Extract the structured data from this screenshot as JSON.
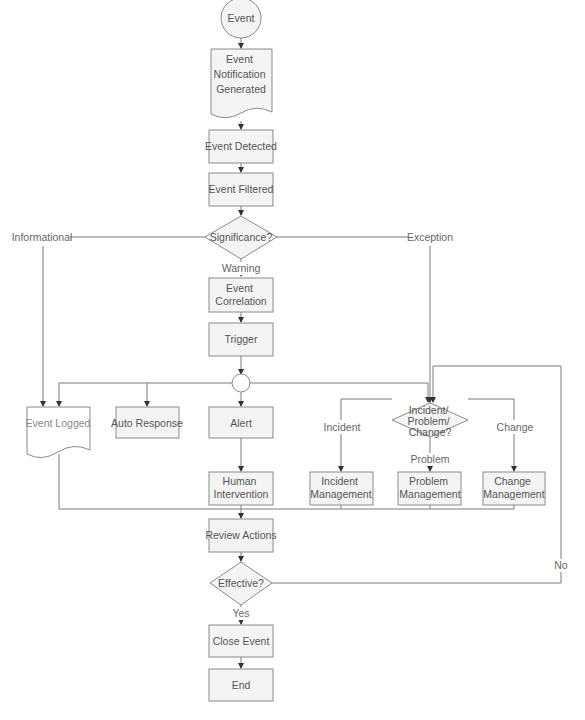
{
  "diagram": {
    "colors": {
      "node_fill": "#f4f4f4",
      "node_stroke": "#8a8a8a",
      "edge": "#7a7a7a",
      "text": "#555555"
    },
    "nodes": {
      "start": "Event",
      "notification": [
        "Event",
        "Notification",
        "Generated"
      ],
      "detected": "Event Detected",
      "filtered": "Event Filtered",
      "significance": "Significance?",
      "correlation": [
        "Event",
        "Correlation"
      ],
      "trigger": "Trigger",
      "logged": "Event Logged",
      "auto_response": "Auto Response",
      "alert": "Alert",
      "human": [
        "Human",
        "Intervention"
      ],
      "ipc_decision": [
        "Incident/",
        "Problem/",
        "Change?"
      ],
      "incident_mgmt": [
        "Incident",
        "Management"
      ],
      "problem_mgmt": [
        "Problem",
        "Management"
      ],
      "change_mgmt": [
        "Change",
        "Management"
      ],
      "review": "Review Actions",
      "effective": "Effective?",
      "close": "Close Event",
      "end": "End"
    },
    "edge_labels": {
      "informational": "Informational",
      "exception": "Exception",
      "warning": "Warning",
      "incident": "Incident",
      "problem": "Problem",
      "change": "Change",
      "yes": "Yes",
      "no": "No"
    }
  }
}
